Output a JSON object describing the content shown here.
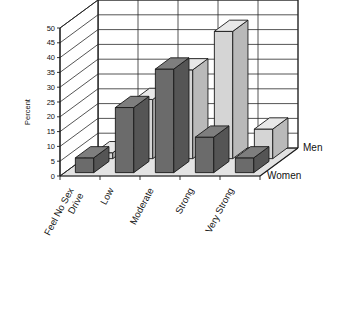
{
  "chart_data": {
    "type": "bar",
    "title": "",
    "subtitle": "",
    "xlabel": "",
    "ylabel": "Percent",
    "ylim": [
      0,
      50
    ],
    "ytick_step": 5,
    "yticks": [
      "0",
      "5",
      "10",
      "15",
      "20",
      "25",
      "30",
      "35",
      "40",
      "45",
      "50"
    ],
    "grid": true,
    "three_d": true,
    "legend_position": "right-depth-axis",
    "categories": [
      "Feel No Sex\nDrive",
      "Low",
      "Moderate",
      "Strong",
      "Very Strong"
    ],
    "category_labels_flat": [
      "Feel No Sex Drive",
      "Low",
      "Moderate",
      "Strong",
      "Very Strong"
    ],
    "category_label_lines": [
      [
        "Feel No Sex",
        "Drive"
      ],
      [
        "Low"
      ],
      [
        "Moderate"
      ],
      [
        "Strong"
      ],
      [
        "Very Strong"
      ]
    ],
    "series": [
      {
        "name": "Men",
        "color": "#d5d5d5",
        "values": [
          2,
          20,
          30,
          43,
          10
        ]
      },
      {
        "name": "Women",
        "color": "#6b6b6b",
        "values": [
          5,
          22,
          35,
          12,
          5
        ]
      }
    ]
  },
  "colors": {
    "men_fill": "#d5d5d5",
    "women_fill": "#6b6b6b",
    "men_side": "#b9b9b9",
    "women_side": "#555555",
    "men_top": "#e8e8e8",
    "women_top": "#7e7e7e",
    "floor": "#e3e3e3",
    "floor_edge": "#9a9a9a",
    "grid_line": "#2a2a2a",
    "outline": "#1a1a1a",
    "text": "#111111",
    "background": "#ffffff"
  }
}
